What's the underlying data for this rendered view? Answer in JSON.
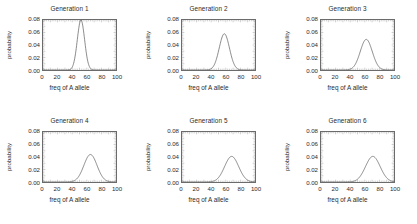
{
  "figure": {
    "layout": {
      "rows": 2,
      "cols": 3
    },
    "axis": {
      "xlabel": "freq of A allele",
      "ylabel": "probability",
      "xticks": [
        "0",
        "20",
        "40",
        "60",
        "80",
        "100"
      ],
      "yticks": [
        "0.00",
        "0.02",
        "0.04",
        "0.06",
        "0.08"
      ]
    }
  },
  "chart_data": [
    {
      "type": "line",
      "title": "Generation 1",
      "xlabel": "freq of A allele",
      "ylabel": "probability",
      "xlim": [
        0,
        100
      ],
      "ylim": [
        0,
        0.08
      ],
      "xticks": [
        0,
        20,
        40,
        60,
        80,
        100
      ],
      "yticks": [
        0.0,
        0.02,
        0.04,
        0.06,
        0.08
      ],
      "grid": false,
      "legend": "none",
      "distribution": {
        "mean": 52,
        "sigma": 5.0,
        "peak": 0.08
      },
      "x": [
        0,
        5,
        10,
        15,
        20,
        25,
        30,
        35,
        40,
        42,
        44,
        46,
        48,
        50,
        52,
        54,
        56,
        58,
        60,
        62,
        64,
        66,
        70,
        75,
        80,
        85,
        90,
        95,
        100
      ],
      "values": [
        0.0,
        0.0,
        0.0,
        0.0,
        0.0,
        0.0,
        0.0,
        0.0001,
        0.0022,
        0.0058,
        0.0126,
        0.0235,
        0.0379,
        0.0527,
        0.063,
        0.0646,
        0.057,
        0.0431,
        0.028,
        0.0156,
        0.0075,
        0.0031,
        0.0003,
        0.0,
        0.0,
        0.0,
        0.0,
        0.0,
        0.0
      ]
    },
    {
      "type": "line",
      "title": "Generation 2",
      "xlabel": "freq of A allele",
      "ylabel": "probability",
      "xlim": [
        0,
        100
      ],
      "ylim": [
        0,
        0.08
      ],
      "xticks": [
        0,
        20,
        40,
        60,
        80,
        100
      ],
      "yticks": [
        0.0,
        0.02,
        0.04,
        0.06,
        0.08
      ],
      "grid": false,
      "legend": "none",
      "distribution": {
        "mean": 58,
        "sigma": 7.0,
        "peak": 0.058
      },
      "x": [
        0,
        5,
        10,
        15,
        20,
        25,
        30,
        35,
        40,
        44,
        48,
        50,
        52,
        54,
        56,
        58,
        60,
        62,
        64,
        66,
        68,
        70,
        75,
        80,
        85,
        90,
        95,
        100
      ],
      "values": [
        0.0,
        0.0,
        0.0,
        0.0,
        0.0,
        0.0,
        0.0001,
        0.0007,
        0.0042,
        0.0119,
        0.0255,
        0.0331,
        0.0404,
        0.0464,
        0.0502,
        0.0515,
        0.0502,
        0.0464,
        0.0404,
        0.0331,
        0.0255,
        0.0185,
        0.0068,
        0.0016,
        0.0002,
        0.0,
        0.0,
        0.0
      ]
    },
    {
      "type": "line",
      "title": "Generation 3",
      "xlabel": "freq of A allele",
      "ylabel": "probability",
      "xlim": [
        0,
        100
      ],
      "ylim": [
        0,
        0.08
      ],
      "xticks": [
        0,
        20,
        40,
        60,
        80,
        100
      ],
      "yticks": [
        0.0,
        0.02,
        0.04,
        0.06,
        0.08
      ],
      "grid": false,
      "legend": "none",
      "distribution": {
        "mean": 62,
        "sigma": 8.2,
        "peak": 0.049
      },
      "x": [
        0,
        5,
        10,
        15,
        20,
        25,
        30,
        35,
        40,
        44,
        48,
        52,
        54,
        56,
        58,
        60,
        62,
        64,
        66,
        68,
        70,
        74,
        78,
        82,
        86,
        90,
        95,
        100
      ],
      "values": [
        0.0,
        0.0,
        0.0,
        0.0,
        0.0,
        0.0001,
        0.0004,
        0.0018,
        0.0062,
        0.0134,
        0.0239,
        0.0365,
        0.0412,
        0.0447,
        0.047,
        0.0479,
        0.0474,
        0.0456,
        0.0425,
        0.0385,
        0.0338,
        0.0234,
        0.014,
        0.0072,
        0.0031,
        0.0011,
        0.0002,
        0.0
      ]
    },
    {
      "type": "line",
      "title": "Generation 4",
      "xlabel": "freq of A allele",
      "ylabel": "probability",
      "xlim": [
        0,
        100
      ],
      "ylim": [
        0,
        0.08
      ],
      "xticks": [
        0,
        20,
        40,
        60,
        80,
        100
      ],
      "yticks": [
        0.0,
        0.02,
        0.04,
        0.06,
        0.08
      ],
      "grid": false,
      "legend": "none",
      "distribution": {
        "mean": 65,
        "sigma": 9.0,
        "peak": 0.044
      },
      "x": [
        0,
        5,
        10,
        15,
        20,
        25,
        30,
        35,
        40,
        44,
        48,
        52,
        56,
        58,
        60,
        62,
        64,
        66,
        68,
        70,
        72,
        76,
        80,
        84,
        88,
        92,
        96,
        100
      ],
      "values": [
        0.0,
        0.0,
        0.0,
        0.0,
        0.0,
        0.0001,
        0.0006,
        0.0022,
        0.0062,
        0.0118,
        0.0198,
        0.0291,
        0.0377,
        0.0407,
        0.0427,
        0.0438,
        0.044,
        0.0432,
        0.0415,
        0.039,
        0.0358,
        0.0283,
        0.0202,
        0.013,
        0.0075,
        0.0039,
        0.0018,
        0.0007
      ]
    },
    {
      "type": "line",
      "title": "Generation 5",
      "xlabel": "freq of A allele",
      "ylabel": "probability",
      "xlim": [
        0,
        100
      ],
      "ylim": [
        0,
        0.08
      ],
      "xticks": [
        0,
        20,
        40,
        60,
        80,
        100
      ],
      "yticks": [
        0.0,
        0.02,
        0.04,
        0.06,
        0.08
      ],
      "grid": false,
      "legend": "none",
      "distribution": {
        "mean": 68,
        "sigma": 9.6,
        "peak": 0.041
      },
      "x": [
        0,
        5,
        10,
        15,
        20,
        25,
        30,
        35,
        40,
        44,
        48,
        52,
        56,
        60,
        62,
        64,
        66,
        68,
        70,
        72,
        74,
        78,
        82,
        86,
        90,
        94,
        97,
        100
      ],
      "values": [
        0.0,
        0.0,
        0.0,
        0.0,
        0.0,
        0.0001,
        0.0005,
        0.0017,
        0.0049,
        0.0096,
        0.0163,
        0.0246,
        0.0328,
        0.0387,
        0.04,
        0.0408,
        0.0412,
        0.0413,
        0.041,
        0.0402,
        0.0388,
        0.0345,
        0.0285,
        0.0218,
        0.0153,
        0.0099,
        0.0067,
        0.0043
      ]
    },
    {
      "type": "line",
      "title": "Generation 6",
      "xlabel": "freq of A allele",
      "ylabel": "probability",
      "xlim": [
        0,
        100
      ],
      "ylim": [
        0,
        0.08
      ],
      "xticks": [
        0,
        20,
        40,
        60,
        80,
        100
      ],
      "yticks": [
        0.0,
        0.02,
        0.04,
        0.06,
        0.08
      ],
      "grid": false,
      "legend": "none",
      "distribution": {
        "mean": 71,
        "sigma": 10.0,
        "peak": 0.041
      },
      "x": [
        0,
        5,
        10,
        15,
        20,
        25,
        30,
        35,
        40,
        44,
        48,
        52,
        56,
        60,
        64,
        66,
        68,
        70,
        72,
        74,
        76,
        80,
        84,
        88,
        92,
        95,
        98,
        100
      ],
      "values": [
        0.0,
        0.0,
        0.0,
        0.0,
        0.0,
        0.0,
        0.0003,
        0.0011,
        0.0032,
        0.0066,
        0.0117,
        0.0184,
        0.0259,
        0.0329,
        0.0383,
        0.0398,
        0.0407,
        0.041,
        0.0407,
        0.0398,
        0.0383,
        0.0339,
        0.028,
        0.0216,
        0.0156,
        0.0119,
        0.0088,
        0.0072
      ]
    }
  ]
}
